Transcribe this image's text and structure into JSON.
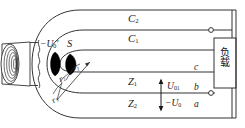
{
  "figure": {
    "type": "technical-diagram",
    "background_color": "#ffffff",
    "line_color": "#333333",
    "fill_color": "#000000"
  },
  "labels": {
    "capacitor_outer": "C",
    "capacitor_outer_sub": "2",
    "capacitor_inner": "C",
    "capacitor_inner_sub": "1",
    "impedance_inner": "Z",
    "impedance_inner_sub": "1",
    "impedance_outer": "Z",
    "impedance_outer_sub": "2",
    "source_voltage": "−U",
    "source_voltage_sub": "0",
    "source_voltage_prime": "′",
    "gap_label": "S",
    "radius_1": "r",
    "radius_1_sub": "1",
    "radius_2": "r",
    "radius_2_sub": "2",
    "radius_3": "r",
    "radius_3_sub": "3",
    "voltage_mid": "U",
    "voltage_mid_sub": "01",
    "voltage_bottom": "−U",
    "voltage_bottom_sub": "0",
    "terminal_c": "c",
    "terminal_b": "b",
    "terminal_a": "a"
  },
  "load_box": {
    "line1": "负",
    "line2": "载"
  },
  "terminals": {
    "upper_node": "open-circle-terminal",
    "lower_node": "open-circle-terminal"
  },
  "annotations": {
    "voltage_arrow": "double-headed-vertical-arrow"
  }
}
